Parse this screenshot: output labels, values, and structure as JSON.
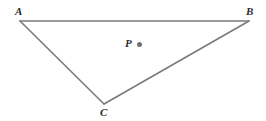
{
  "figure": {
    "name": "triangle-with-interior-point",
    "background_color": "#ffffff",
    "stroke_color": "#7a7a7a",
    "stroke_width": 1.6,
    "label_color": "#2a2a2a",
    "point_color": "#6e6e6e",
    "width": 266,
    "height": 121
  },
  "labels": {
    "a": "A",
    "b": "B",
    "c": "C",
    "p": "P"
  },
  "geometry": {
    "vertices": [
      {
        "id": "A",
        "label": "A",
        "x": 20,
        "y": 21
      },
      {
        "id": "B",
        "label": "B",
        "x": 249,
        "y": 21
      },
      {
        "id": "C",
        "label": "C",
        "x": 104,
        "y": 104
      }
    ],
    "interior_point": {
      "id": "P",
      "label": "P",
      "x": 140,
      "y": 45
    },
    "edges": [
      {
        "id": "AB",
        "from": "A",
        "to": "B"
      },
      {
        "id": "BC",
        "from": "B",
        "to": "C"
      },
      {
        "id": "CA",
        "from": "C",
        "to": "A"
      }
    ]
  }
}
